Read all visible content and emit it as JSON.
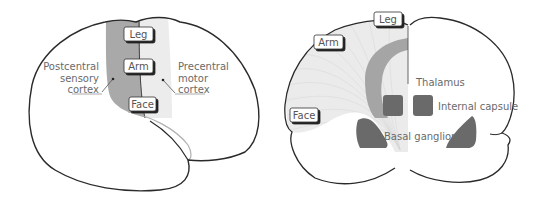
{
  "left_diagram": {
    "title": "Lateral view of brain",
    "box_labels": {
      "leg": "Leg",
      "arm": "Arm",
      "face": "Face"
    },
    "annotations": {
      "postcentral_line1": "Postcentral",
      "postcentral_line2": "sensory",
      "postcentral_line3": "cortex",
      "precentral_line1": "Precentral",
      "precentral_line2": "motor",
      "precentral_line3": "cortex"
    }
  },
  "right_diagram": {
    "title": "Coronal section of brain",
    "box_labels": {
      "leg": "Leg",
      "arm": "Arm",
      "face": "Face"
    },
    "annotations": {
      "thalamus": "Thalamus",
      "internal_capsule": "Internal capsule",
      "basal_ganglion": "Basal ganglion"
    }
  },
  "colors": {
    "outline": "#2a2a2a",
    "postcentral_fill": "#a8a8a8",
    "precentral_fill": "#ececec",
    "fiber_light": "#e8e8e8",
    "fiber_dark": "#a0a0a0",
    "nuclei": "#6a6a6a",
    "text": "#666666"
  }
}
